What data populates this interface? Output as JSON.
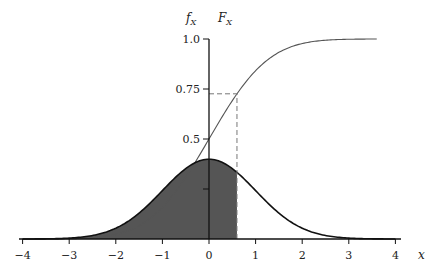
{
  "chart_data": {
    "type": "line",
    "title": "",
    "xlabel": "x",
    "ylabel_left": "f_X",
    "ylabel_right": "F_X",
    "xlim": [
      -4,
      4
    ],
    "ylim": [
      0,
      1.0
    ],
    "x_ticks": [
      -4,
      -3,
      -2,
      -1,
      0,
      1,
      2,
      3,
      4
    ],
    "x_tick_labels": [
      "−4",
      "−3",
      "−2",
      "−1",
      "0",
      "1",
      "2",
      "3",
      "4"
    ],
    "y_ticks": [
      0.25,
      0.5,
      0.75,
      1.0
    ],
    "y_tick_labels": [
      "",
      "0.5",
      "0.75",
      "1.0"
    ],
    "grid": false,
    "legend": "none",
    "series": [
      {
        "name": "f_X (PDF)",
        "kind": "normal-pdf",
        "mu": 0,
        "sigma": 1,
        "x_range": [
          -4,
          4
        ],
        "color": "#111111",
        "stroke_width": 1.6
      },
      {
        "name": "F_X (CDF)",
        "kind": "normal-cdf",
        "mu": 0,
        "sigma": 1,
        "x_range": [
          -4,
          3.6
        ],
        "color": "#555555",
        "stroke_width": 1.1
      }
    ],
    "shaded_region": {
      "under": "f_X (PDF)",
      "from": -4,
      "to": 0.6,
      "color": "#555555"
    },
    "annotations": [
      {
        "type": "dashed-vertical",
        "x": 0.6,
        "from_y": 0,
        "to_y": 0.726
      },
      {
        "type": "dashed-horizontal",
        "y": 0.726,
        "from_x": 0,
        "to_x": 0.6
      }
    ]
  }
}
